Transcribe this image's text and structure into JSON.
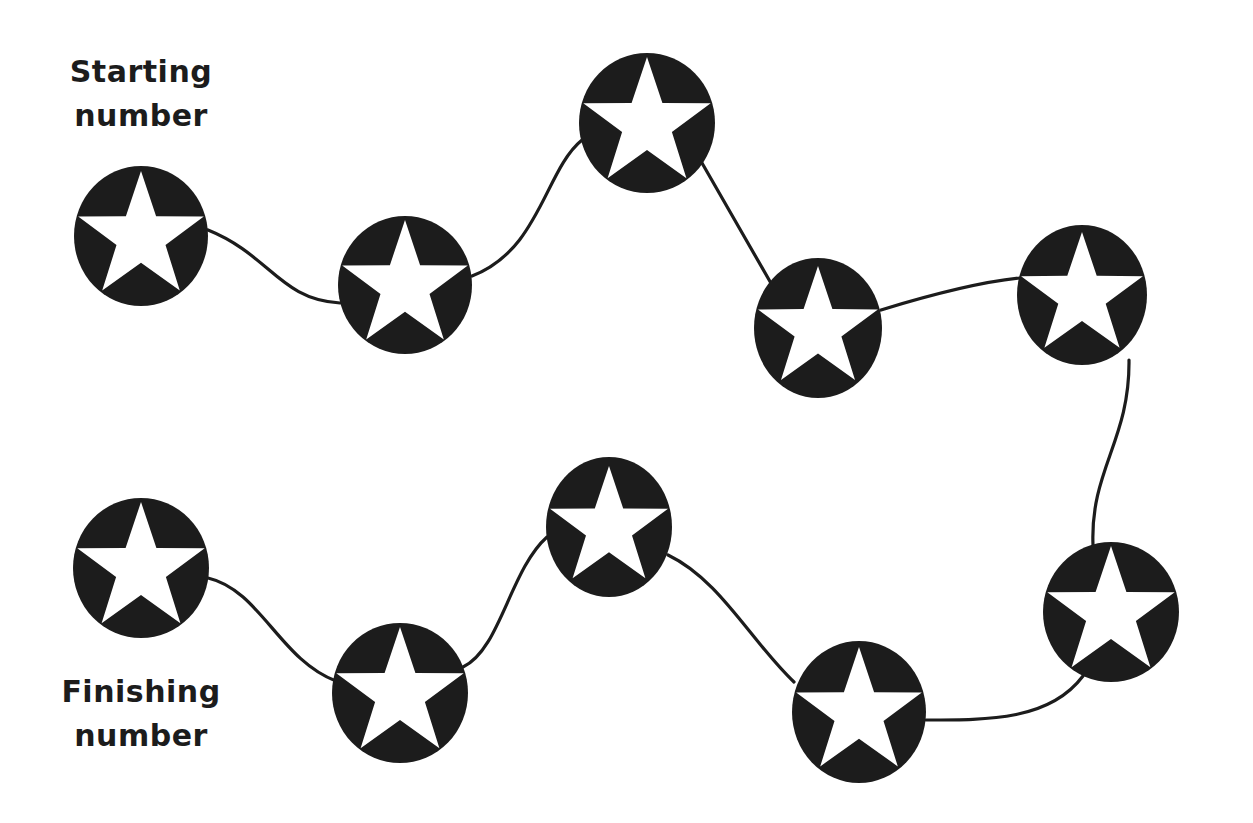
{
  "labels": {
    "start_line1": "Starting",
    "start_line2": "number",
    "finish_line1": "Finishing",
    "finish_line2": "number"
  },
  "colors": {
    "ink": "#1c1c1c",
    "background": "#ffffff",
    "star": "#ffffff"
  },
  "nodes": [
    {
      "id": 1,
      "role": "start",
      "cx": 141,
      "cy": 236,
      "rx": 67,
      "ry": 70,
      "icon": "star-icon"
    },
    {
      "id": 2,
      "cx": 405,
      "cy": 285,
      "rx": 67,
      "ry": 69,
      "icon": "star-icon"
    },
    {
      "id": 3,
      "cx": 647,
      "cy": 123,
      "rx": 68,
      "ry": 70,
      "icon": "star-icon"
    },
    {
      "id": 4,
      "cx": 818,
      "cy": 328,
      "rx": 64,
      "ry": 70,
      "icon": "star-icon"
    },
    {
      "id": 5,
      "cx": 1082,
      "cy": 295,
      "rx": 65,
      "ry": 70,
      "icon": "star-icon"
    },
    {
      "id": 6,
      "cx": 1111,
      "cy": 612,
      "rx": 68,
      "ry": 70,
      "icon": "star-icon"
    },
    {
      "id": 7,
      "cx": 859,
      "cy": 712,
      "rx": 67,
      "ry": 71,
      "icon": "star-icon"
    },
    {
      "id": 8,
      "cx": 609,
      "cy": 527,
      "rx": 63,
      "ry": 70,
      "icon": "star-icon"
    },
    {
      "id": 9,
      "cx": 400,
      "cy": 693,
      "rx": 68,
      "ry": 70,
      "icon": "star-icon"
    },
    {
      "id": 10,
      "role": "finish",
      "cx": 141,
      "cy": 568,
      "rx": 68,
      "ry": 70,
      "icon": "star-icon"
    }
  ],
  "connectors": [
    "M 208 230 C 270 255, 280 300, 340 303",
    "M 472 276 C 540 250, 545 170, 582 140",
    "M 702 163 L 772 285",
    "M 881 310 C 930 295, 980 282, 1020 278",
    "M 1129 360 C 1130 440, 1090 470, 1093 545",
    "M 1083 676 C 1050 720, 990 720, 926 720",
    "M 794 682 C 750 640, 720 580, 668 555",
    "M 547 537 C 510 570, 500 650, 463 667",
    "M 336 681 C 280 660, 260 590, 208 578"
  ]
}
